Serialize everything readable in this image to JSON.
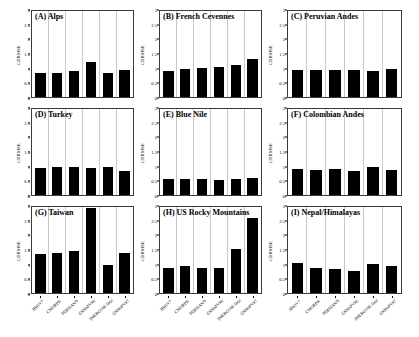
{
  "figure": {
    "ylabel": "CDRMSE",
    "yticks": [
      "0",
      "0.5",
      "1",
      "1.5",
      "2",
      "2.5",
      "3"
    ],
    "categories": [
      "3B42V7",
      "CMORPH",
      "PERSIANN",
      "GSMaPV06",
      "IMERGV06 final",
      "GSMaPV07"
    ]
  },
  "chart_data": {
    "type": "bar",
    "title": "",
    "xlabel": "",
    "ylabel": "CDRMSE",
    "ylim": [
      0,
      3
    ],
    "yticks": [
      0,
      0.5,
      1,
      1.5,
      2,
      2.5,
      3
    ],
    "grid": true,
    "legend": "none",
    "categories": [
      "3B42V7",
      "CMORPH",
      "PERSIANN",
      "GSMaPV06",
      "IMERGV06 final",
      "GSMaPV07"
    ],
    "panels": [
      {
        "id": "A",
        "title": "(A) Alps",
        "values": [
          0.85,
          0.83,
          0.91,
          1.21,
          0.83,
          0.95
        ]
      },
      {
        "id": "B",
        "title": "(B) French Cevennes",
        "values": [
          0.92,
          0.97,
          1.02,
          1.06,
          1.13,
          1.32
        ]
      },
      {
        "id": "C",
        "title": "(C) Peruvian Andes",
        "values": [
          0.95,
          0.95,
          0.95,
          0.95,
          0.9,
          0.98
        ]
      },
      {
        "id": "D",
        "title": "(D) Turkey",
        "values": [
          0.95,
          0.96,
          0.96,
          0.95,
          0.98,
          0.85
        ]
      },
      {
        "id": "E",
        "title": "(E) Blue Nile",
        "values": [
          0.56,
          0.57,
          0.56,
          0.52,
          0.55,
          0.58
        ]
      },
      {
        "id": "F",
        "title": "(F) Colombian Andes",
        "values": [
          0.92,
          0.87,
          0.92,
          0.84,
          0.96,
          0.86
        ]
      },
      {
        "id": "G",
        "title": "(G) Taiwan",
        "values": [
          1.35,
          1.38,
          1.46,
          2.95,
          0.96,
          1.4
        ]
      },
      {
        "id": "H",
        "title": "(H) US Rocky Mountains",
        "values": [
          0.86,
          0.93,
          0.86,
          0.89,
          1.55,
          2.6
        ]
      },
      {
        "id": "I",
        "title": "(I) Nepal/Himalayas",
        "values": [
          1.05,
          0.86,
          0.84,
          0.76,
          1.02,
          0.95
        ]
      }
    ]
  }
}
